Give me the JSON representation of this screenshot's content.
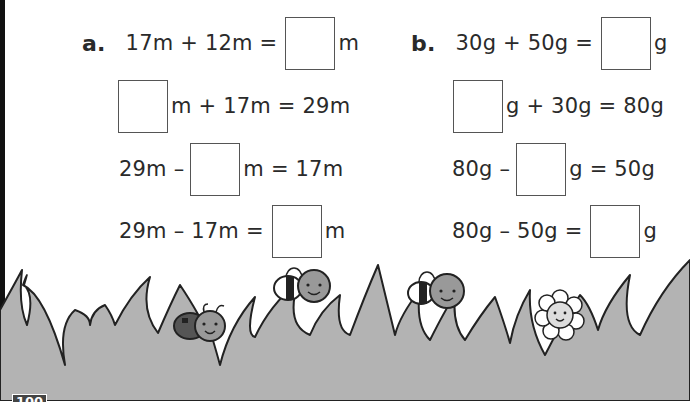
{
  "section_a": {
    "label": "a.",
    "unit": "m",
    "rows": [
      {
        "before": "17m + 12m =",
        "after": "m"
      },
      {
        "before": "",
        "after": "m + 17m = 29m"
      },
      {
        "before": "29m –",
        "after": "m = 17m"
      },
      {
        "before": "29m – 17m =",
        "after": "m"
      }
    ]
  },
  "section_b": {
    "label": "b.",
    "unit": "g",
    "rows": [
      {
        "before": "30g + 50g =",
        "after": "g"
      },
      {
        "before": "",
        "after": "g + 30g = 80g"
      },
      {
        "before": "80g –",
        "after": "g = 50g"
      },
      {
        "before": "80g – 50g =",
        "after": "g"
      }
    ]
  },
  "illustration": {
    "items": [
      "grass",
      "ladybird",
      "bee",
      "bee",
      "flower"
    ]
  },
  "footer": {
    "page_number": "100"
  },
  "colors": {
    "grass_fill": "#b3b3b3",
    "outline": "#222222",
    "box_border": "#555555"
  }
}
